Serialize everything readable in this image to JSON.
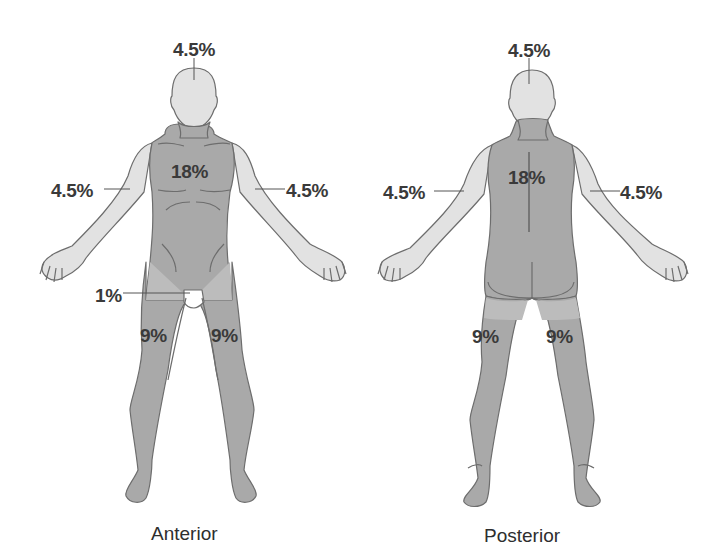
{
  "diagram": {
    "colors": {
      "torso_legs": "#a9a9a9",
      "head_arms": "#e2e2e2",
      "outline": "#6d6d6d",
      "genital": "#ffffff",
      "text": "#3a3a3a"
    },
    "anterior": {
      "caption": "Anterior",
      "labels": {
        "head": "4.5%",
        "trunk": "18%",
        "right_arm": "4.5%",
        "left_arm": "4.5%",
        "genitalia": "1%",
        "right_leg": "9%",
        "left_leg": "9%"
      }
    },
    "posterior": {
      "caption": "Posterior",
      "labels": {
        "head": "4.5%",
        "trunk": "18%",
        "left_arm": "4.5%",
        "right_arm": "4.5%",
        "left_leg": "9%",
        "right_leg": "9%"
      }
    }
  }
}
